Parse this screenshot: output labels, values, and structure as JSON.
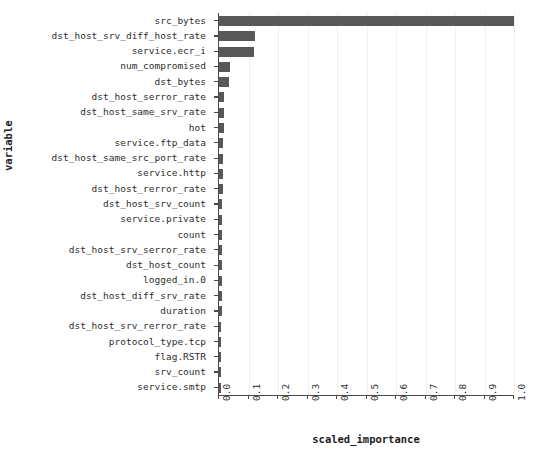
{
  "chart_data": {
    "type": "bar",
    "orientation": "horizontal",
    "title": "",
    "xlabel": "scaled_importance",
    "ylabel": "variable",
    "xlim": [
      0.0,
      1.0
    ],
    "xticks": [
      "0.0",
      "0.1",
      "0.2",
      "0.3",
      "0.4",
      "0.5",
      "0.6",
      "0.7",
      "0.8",
      "0.9",
      "1.0"
    ],
    "xtick_values": [
      0.0,
      0.1,
      0.2,
      0.3,
      0.4,
      0.5,
      0.6,
      0.7,
      0.8,
      0.9,
      1.0
    ],
    "grid": true,
    "grid_axis": "x",
    "legend": "none",
    "bar_color": "#585858",
    "categories": [
      "src_bytes",
      "dst_host_srv_diff_host_rate",
      "service.ecr_i",
      "num_compromised",
      "dst_bytes",
      "dst_host_serror_rate",
      "dst_host_same_srv_rate",
      "hot",
      "service.ftp_data",
      "dst_host_same_src_port_rate",
      "service.http",
      "dst_host_rerror_rate",
      "dst_host_srv_count",
      "service.private",
      "count",
      "dst_host_srv_serror_rate",
      "dst_host_count",
      "logged_in.0",
      "dst_host_diff_srv_rate",
      "duration",
      "dst_host_srv_rerror_rate",
      "protocol_type.tcp",
      "flag.RSTR",
      "srv_count",
      "service.smtp"
    ],
    "values": [
      1.0,
      0.122,
      0.119,
      0.036,
      0.034,
      0.017,
      0.017,
      0.016,
      0.015,
      0.014,
      0.012,
      0.012,
      0.011,
      0.011,
      0.01,
      0.01,
      0.01,
      0.01,
      0.009,
      0.009,
      0.008,
      0.008,
      0.007,
      0.007,
      0.006
    ]
  }
}
